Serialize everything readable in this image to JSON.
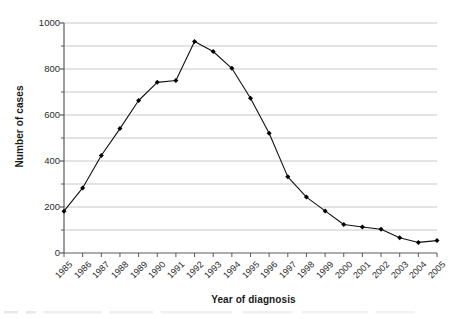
{
  "chart_data": {
    "type": "line",
    "title": "",
    "xlabel": "Year of diagnosis",
    "ylabel": "Number of cases",
    "categories": [
      "1985",
      "1986",
      "1987",
      "1988",
      "1989",
      "1990",
      "1991",
      "1992",
      "1993",
      "1994",
      "1995",
      "1996",
      "1997",
      "1998",
      "1999",
      "2000",
      "2001",
      "2002",
      "2003",
      "2004",
      "2005"
    ],
    "values": [
      182,
      283,
      424,
      541,
      663,
      742,
      750,
      920,
      876,
      803,
      673,
      521,
      331,
      243,
      183,
      124,
      113,
      103,
      66,
      46,
      54
    ],
    "series": [
      {
        "name": "Number of cases",
        "values": [
          182,
          283,
          424,
          541,
          663,
          742,
          750,
          920,
          876,
          803,
          673,
          521,
          331,
          243,
          183,
          124,
          113,
          103,
          66,
          46,
          54
        ]
      }
    ],
    "ylim": [
      0,
      1000
    ],
    "y_major_ticks": [
      0,
      200,
      400,
      600,
      800,
      1000
    ],
    "y_major_tick_labels": [
      "0",
      "200",
      "400",
      "600",
      "800",
      "1000"
    ],
    "y_minor_ticks": [
      100,
      300,
      500,
      700,
      900
    ],
    "grid": "horizontal",
    "grid_color": "#c8c8c8",
    "legend": "none",
    "marker": "filled-diamond",
    "line_color": "#111111",
    "marker_color": "#000000",
    "background": "#ffffff",
    "xtick_rotation": -45
  },
  "axes": {
    "y_axis_name": "y-axis",
    "x_axis_name": "x-axis"
  }
}
